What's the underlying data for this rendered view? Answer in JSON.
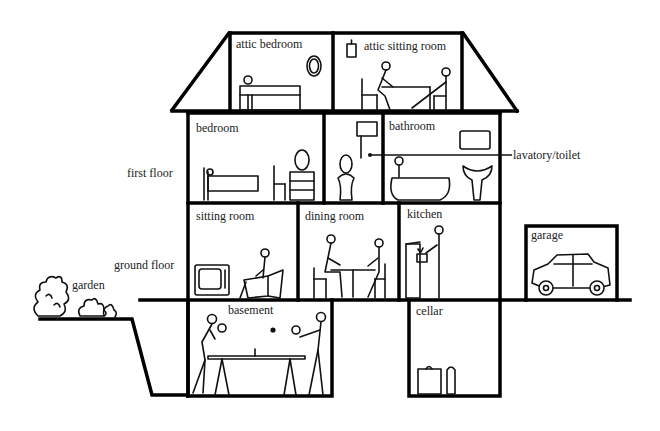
{
  "diagram": {
    "type": "labeled-illustration",
    "colors": {
      "line": "#000000",
      "background": "#ffffff",
      "text": "#222222"
    }
  },
  "floors": {
    "first_floor": "first floor",
    "ground_floor": "ground floor"
  },
  "rooms": {
    "attic_bedroom": "attic bedroom",
    "attic_sitting_room": "attic sitting room",
    "bedroom": "bedroom",
    "bathroom": "bathroom",
    "lavatory": "lavatory/toilet",
    "sitting_room": "sitting room",
    "dining_room": "dining room",
    "kitchen": "kitchen",
    "garage": "garage",
    "basement": "basement",
    "cellar": "cellar"
  },
  "outdoor": {
    "garden": "garden"
  }
}
